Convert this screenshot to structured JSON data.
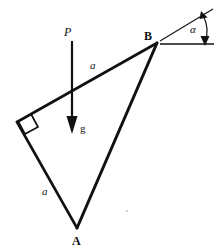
{
  "figure": {
    "kind": "mechanics-free-body-diagram",
    "background_color": "#ffffff",
    "stroke_color": "#111111",
    "width": 223,
    "height": 251
  },
  "vertices": [
    {
      "id": "B",
      "label": "B",
      "x": 157,
      "y": 43,
      "label_x": 144,
      "label_y": 30
    },
    {
      "id": "A",
      "label": "A",
      "x": 77,
      "y": 228,
      "label_x": 72,
      "label_y": 235
    },
    {
      "id": "C",
      "label": "",
      "x": 17,
      "y": 122,
      "label_x": 0,
      "label_y": 0
    }
  ],
  "side_labels": [
    {
      "id": "side-upper",
      "label": "a",
      "x": 90,
      "y": 60
    },
    {
      "id": "side-lower",
      "label": "a",
      "x": 42,
      "y": 186
    }
  ],
  "force": {
    "label": "P",
    "label_x": 64,
    "label_y": 26,
    "arrow_x": 72,
    "arrow_y_start": 41,
    "arrow_y_end": 132
  },
  "gravity": {
    "label": "g",
    "label_x": 80,
    "label_y": 123
  },
  "angle": {
    "label": "α",
    "label_x": 190,
    "label_y": 24,
    "vertex_x": 157,
    "vertex_y": 43,
    "ray_horizontal_end_x": 214,
    "ray_inclined_end_x": 213,
    "ray_inclined_end_y": 9
  },
  "right_angle_marker": {
    "present": true,
    "at_vertex": "C"
  },
  "speck": {
    "x": 127,
    "y": 211
  }
}
